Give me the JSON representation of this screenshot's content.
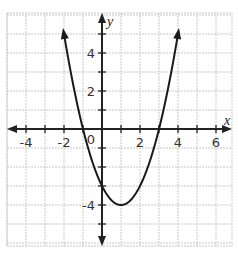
{
  "chart_data": {
    "type": "line",
    "title": "",
    "function": "y = x^2 - 2x - 3",
    "xlabel": "x",
    "ylabel": "y",
    "xlim": [
      -5,
      7
    ],
    "ylim": [
      -6,
      6
    ],
    "grid": true,
    "x_tick_labels": [
      "-4",
      "-2",
      "0",
      "2",
      "4",
      "6"
    ],
    "y_tick_labels": [
      "4",
      "2",
      "-4"
    ],
    "origin_label": "0",
    "series": [
      {
        "name": "parabola",
        "x": [
          -2,
          -1.5,
          -1,
          0,
          1,
          2,
          3,
          3.5,
          4
        ],
        "y": [
          5,
          2.25,
          0,
          -3,
          -4,
          -3,
          0,
          2.25,
          5
        ]
      }
    ],
    "annotations": {
      "vertex": [
        1,
        -4
      ],
      "x_intercepts": [
        -1,
        3
      ],
      "y_intercept": -3
    }
  },
  "colors": {
    "grid": "#c8c8c8",
    "axis": "#222222",
    "curve": "#1a1a1a"
  }
}
